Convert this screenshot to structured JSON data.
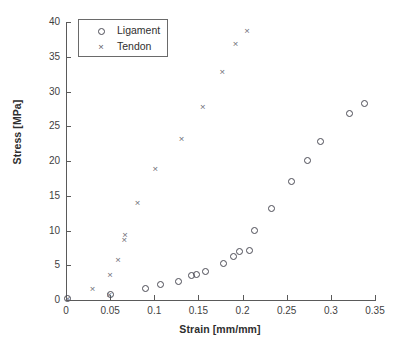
{
  "chart_data": {
    "type": "scatter",
    "title": "",
    "xlabel": "Strain [mm/mm]",
    "ylabel": "Stress [MPa]",
    "xlim": [
      0,
      0.35
    ],
    "ylim": [
      0,
      40
    ],
    "xticks": [
      0,
      0.05,
      0.1,
      0.15,
      0.2,
      0.25,
      0.3,
      0.35
    ],
    "xticklabels": [
      "0",
      "0.05",
      "0.1",
      "0.15",
      "0.2",
      "0.25",
      "0.3",
      "0.35"
    ],
    "yticks": [
      0,
      5,
      10,
      15,
      20,
      25,
      30,
      35,
      40
    ],
    "yticklabels": [
      "0",
      "5",
      "10",
      "15",
      "20",
      "25",
      "30",
      "35",
      "40"
    ],
    "grid": false,
    "legend_position": "upper-left-inside",
    "series": [
      {
        "name": "Ligament",
        "marker": "circle",
        "color": "#4b4b55",
        "points": [
          [
            0.002,
            0.2
          ],
          [
            0.05,
            0.8
          ],
          [
            0.09,
            1.6
          ],
          [
            0.107,
            2.3
          ],
          [
            0.127,
            2.7
          ],
          [
            0.142,
            3.5
          ],
          [
            0.148,
            3.6
          ],
          [
            0.158,
            4.1
          ],
          [
            0.178,
            5.2
          ],
          [
            0.19,
            6.3
          ],
          [
            0.196,
            7.0
          ],
          [
            0.208,
            7.1
          ],
          [
            0.213,
            10.0
          ],
          [
            0.233,
            13.1
          ],
          [
            0.255,
            17.0
          ],
          [
            0.274,
            20.1
          ],
          [
            0.288,
            22.8
          ],
          [
            0.321,
            26.8
          ],
          [
            0.338,
            28.3
          ]
        ]
      },
      {
        "name": "Tendon",
        "marker": "cross",
        "color": "#6d6d76",
        "points": [
          [
            0.002,
            0.2
          ],
          [
            0.03,
            1.6
          ],
          [
            0.049,
            0.7
          ],
          [
            0.05,
            3.6
          ],
          [
            0.059,
            5.7
          ],
          [
            0.066,
            8.6
          ],
          [
            0.067,
            9.3
          ],
          [
            0.081,
            13.9
          ],
          [
            0.101,
            18.8
          ],
          [
            0.131,
            23.2
          ],
          [
            0.155,
            27.8
          ],
          [
            0.177,
            32.8
          ],
          [
            0.192,
            36.8
          ],
          [
            0.205,
            38.7
          ]
        ]
      }
    ]
  },
  "legend": {
    "items": [
      {
        "label": "Ligament",
        "marker": "circle"
      },
      {
        "label": "Tendon",
        "marker": "×"
      }
    ]
  },
  "caption": ""
}
